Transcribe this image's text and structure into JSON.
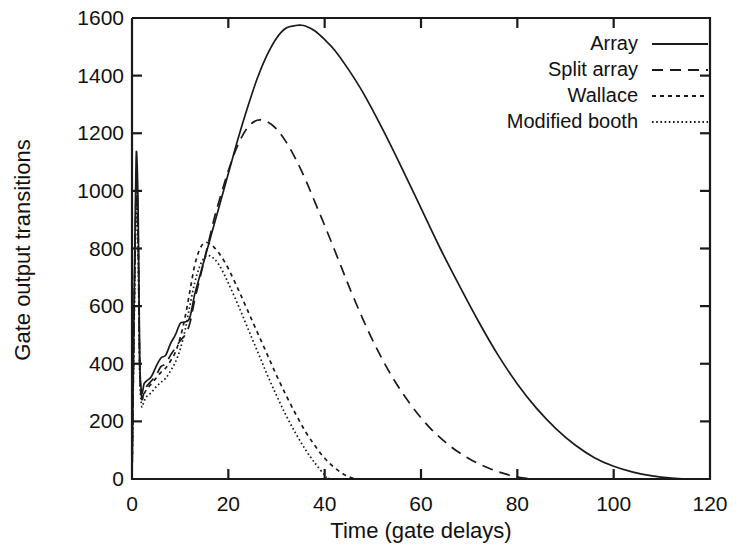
{
  "chart_data": {
    "type": "line",
    "title": "",
    "xlabel": "Time (gate delays)",
    "ylabel": "Gate output transitions",
    "xlim": [
      0,
      120
    ],
    "ylim": [
      0,
      1600
    ],
    "xticks": [
      0,
      20,
      40,
      60,
      80,
      100,
      120
    ],
    "yticks": [
      0,
      200,
      400,
      600,
      800,
      1000,
      1200,
      1400,
      1600
    ],
    "grid": false,
    "legend_position": "top-right",
    "legend": [
      "Array",
      "Split array",
      "Wallace",
      "Modified booth"
    ],
    "series": [
      {
        "name": "Array",
        "style": "solid",
        "peak_x": 35,
        "peak_y": 1575,
        "end_x": 115,
        "x": [
          0,
          0.4,
          0.8,
          1.0,
          1.3,
          1.6,
          2.0,
          2.5,
          3,
          4,
          5,
          6,
          7,
          8,
          9,
          10,
          11,
          12,
          13,
          14,
          15,
          16,
          17,
          18,
          20,
          22,
          24,
          26,
          28,
          30,
          32,
          34,
          35,
          36,
          38,
          40,
          42,
          45,
          48,
          52,
          56,
          60,
          64,
          68,
          72,
          76,
          80,
          84,
          88,
          92,
          96,
          100,
          104,
          108,
          112,
          115,
          118,
          120
        ],
        "y": [
          0,
          560,
          1060,
          1120,
          900,
          420,
          300,
          330,
          340,
          355,
          390,
          420,
          430,
          470,
          500,
          540,
          545,
          560,
          640,
          700,
          760,
          820,
          880,
          940,
          1060,
          1180,
          1290,
          1390,
          1470,
          1530,
          1565,
          1574,
          1575,
          1572,
          1555,
          1525,
          1490,
          1420,
          1340,
          1215,
          1080,
          940,
          800,
          670,
          545,
          430,
          330,
          245,
          175,
          118,
          74,
          44,
          24,
          11,
          3,
          0,
          0,
          0
        ]
      },
      {
        "name": "Split array",
        "style": "dashed",
        "peak_x": 26,
        "peak_y": 1245,
        "end_x": 82,
        "x": [
          0,
          0.4,
          0.8,
          1.0,
          1.3,
          1.6,
          2.0,
          2.5,
          3,
          4,
          5,
          6,
          7,
          8,
          9,
          10,
          11,
          12,
          13,
          14,
          15,
          16,
          17,
          18,
          20,
          22,
          24,
          26,
          28,
          30,
          32,
          34,
          36,
          38,
          40,
          43,
          46,
          50,
          54,
          58,
          62,
          66,
          70,
          74,
          78,
          82,
          86,
          90,
          120
        ],
        "y": [
          0,
          520,
          980,
          1040,
          830,
          400,
          285,
          300,
          320,
          340,
          360,
          390,
          400,
          430,
          455,
          480,
          500,
          540,
          620,
          690,
          760,
          830,
          900,
          960,
          1070,
          1160,
          1220,
          1245,
          1240,
          1215,
          1170,
          1110,
          1040,
          960,
          880,
          755,
          630,
          480,
          355,
          255,
          175,
          115,
          70,
          38,
          15,
          2,
          0,
          0,
          0
        ]
      },
      {
        "name": "Wallace",
        "style": "dotted-coarse",
        "peak_x": 15,
        "peak_y": 820,
        "end_x": 46,
        "x": [
          0,
          0.4,
          0.8,
          1.0,
          1.3,
          1.6,
          2.0,
          2.5,
          3,
          4,
          5,
          6,
          7,
          8,
          9,
          10,
          11,
          12,
          13,
          14,
          15,
          16,
          17,
          18,
          19,
          20,
          22,
          24,
          26,
          28,
          30,
          32,
          34,
          36,
          38,
          40,
          42,
          44,
          46,
          48,
          50,
          120
        ],
        "y": [
          0,
          510,
          960,
          1010,
          800,
          390,
          280,
          295,
          310,
          330,
          350,
          370,
          385,
          410,
          440,
          490,
          560,
          650,
          740,
          795,
          820,
          818,
          805,
          785,
          760,
          730,
          660,
          585,
          510,
          435,
          360,
          290,
          225,
          165,
          115,
          72,
          40,
          16,
          2,
          0,
          0,
          0
        ]
      },
      {
        "name": "Modified booth",
        "style": "dotted-fine",
        "peak_x": 16,
        "peak_y": 775,
        "end_x": 41,
        "x": [
          0,
          0.4,
          0.8,
          1.0,
          1.3,
          1.6,
          2.0,
          2.5,
          3,
          4,
          5,
          6,
          7,
          8,
          9,
          10,
          11,
          12,
          13,
          14,
          15,
          16,
          17,
          18,
          19,
          20,
          22,
          24,
          26,
          28,
          30,
          32,
          34,
          36,
          38,
          40,
          41,
          44,
          120
        ],
        "y": [
          0,
          480,
          900,
          960,
          760,
          370,
          255,
          270,
          285,
          300,
          320,
          335,
          350,
          375,
          405,
          450,
          515,
          600,
          680,
          735,
          768,
          775,
          765,
          745,
          715,
          680,
          605,
          525,
          445,
          365,
          290,
          220,
          158,
          102,
          55,
          14,
          2,
          0,
          0
        ]
      }
    ]
  },
  "axis": {
    "y_tick_labels": [
      "1600",
      "1400",
      "1200",
      "1000",
      "800",
      "600",
      "400",
      "200",
      "0"
    ],
    "x_tick_labels": [
      "0",
      "20",
      "40",
      "60",
      "80",
      "100",
      "120"
    ],
    "x_title": "Time (gate delays)",
    "y_title": "Gate output transitions"
  },
  "legend": {
    "items": [
      {
        "label": "Array",
        "style": "solid"
      },
      {
        "label": "Split array",
        "style": "dashed"
      },
      {
        "label": "Wallace",
        "style": "dotted-coarse"
      },
      {
        "label": "Modified booth",
        "style": "dotted-fine"
      }
    ]
  },
  "colors": {
    "ink": "#1a1a1a",
    "background": "#ffffff"
  }
}
